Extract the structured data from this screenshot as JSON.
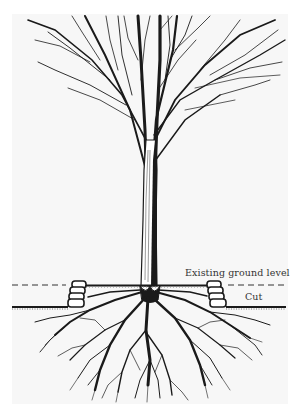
{
  "figure": {
    "labels": {
      "existing_ground_level": "Existing ground level",
      "cut": "Cut"
    },
    "caption": "",
    "colors": {
      "ink": "#1a1a1a",
      "page": "#f7f7f7",
      "background": "#ffffff"
    },
    "icons": {
      "tree": "tree-illustration",
      "roots": "root-system",
      "wall_left": "stone-retaining-wall",
      "wall_right": "stone-retaining-wall"
    }
  }
}
